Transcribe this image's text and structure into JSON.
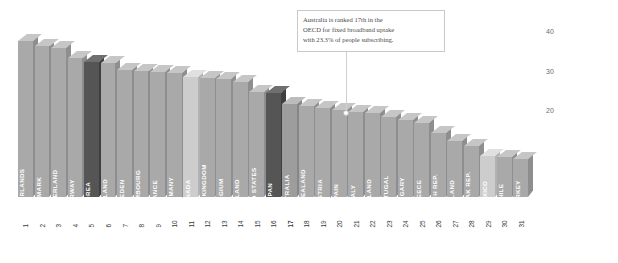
{
  "chart_data": {
    "type": "bar",
    "title": "",
    "xlabel": "",
    "ylabel": "",
    "ylim": [
      0,
      45
    ],
    "yticks": [
      20,
      30,
      40
    ],
    "grid": false,
    "legend": "none",
    "categories": [
      "NETHERLANDS",
      "DENMARK",
      "SWITZERLAND",
      "NORWAY",
      "KOREA",
      "ICELAND",
      "SWEDEN",
      "LUXEMBOURG",
      "FRANCE",
      "GERMANY",
      "CANADA",
      "UNITED KINGDOM",
      "BELGIUM",
      "FINLAND",
      "UNITED STATES",
      "JAPAN",
      "AUSTRALIA",
      "NEW ZEALAND",
      "AUSTRIA",
      "SPAIN",
      "ITALY",
      "IRELAND",
      "PORTUGAL",
      "HUNGARY",
      "GREECE",
      "CZECH REP.",
      "POLAND",
      "SLOVAK REP.",
      "MEXICO",
      "CHILE",
      "TURKEY"
    ],
    "ranks": [
      1,
      2,
      3,
      4,
      5,
      6,
      7,
      8,
      9,
      10,
      11,
      12,
      13,
      14,
      15,
      16,
      17,
      18,
      19,
      20,
      21,
      22,
      23,
      24,
      25,
      26,
      27,
      28,
      29,
      30,
      31
    ],
    "values": [
      39.1,
      37.9,
      37.5,
      35.0,
      34.0,
      33.6,
      32.0,
      31.6,
      31.4,
      31.3,
      30.1,
      30.0,
      29.6,
      28.8,
      26.4,
      26.2,
      23.3,
      23.0,
      22.5,
      21.8,
      21.3,
      21.0,
      20.2,
      19.4,
      18.7,
      16.2,
      14.0,
      12.9,
      10.3,
      10.0,
      9.6
    ],
    "highlights": [
      {
        "index": 4,
        "country": "KOREA",
        "style": "dark"
      },
      {
        "index": 10,
        "country": "CANADA",
        "style": "light"
      },
      {
        "index": 15,
        "country": "JAPAN",
        "style": "dark"
      },
      {
        "index": 16,
        "country": "AUSTRALIA",
        "style": "hi"
      },
      {
        "index": 28,
        "country": "MEXICO",
        "style": "light"
      }
    ],
    "annotation": {
      "line1": "Australia is ranked 17th in the",
      "line2": "OECD for fixed broadband uptake",
      "line3": "with 23.3% of people subscribing.",
      "target_country": "AUSTRALIA",
      "target_rank": 17,
      "target_value": 23.3
    }
  },
  "colors": {
    "bar_default": "#a9a9a9",
    "bar_dark": "#555555",
    "bar_light": "#cdcdcd",
    "bar_highlight": "#9d9d9d",
    "label_text": "#ffffff",
    "axis_text": "#6b6b6b",
    "annotation_border": "#c9c9c9",
    "annotation_text": "#4a4a4a",
    "background": "#ffffff"
  }
}
